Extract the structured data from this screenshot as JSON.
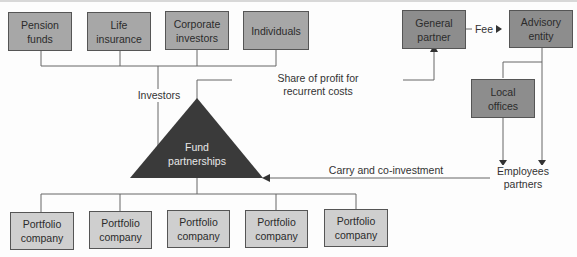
{
  "investors": [
    {
      "label": "Pension\nfunds"
    },
    {
      "label": "Life\ninsurance"
    },
    {
      "label": "Corporate\ninvestors"
    },
    {
      "label": "Individuals"
    }
  ],
  "general_partner": {
    "label": "General\npartner"
  },
  "advisory_entity": {
    "label": "Advisory\nentity"
  },
  "local_offices": {
    "label": "Local\noffices"
  },
  "fund": {
    "label": "Fund\npartnerships"
  },
  "employees": {
    "label": "Employees\npartners"
  },
  "portfolio": [
    {
      "label": "Portfolio\ncompany"
    },
    {
      "label": "Portfolio\ncompany"
    },
    {
      "label": "Portfolio\ncompany"
    },
    {
      "label": "Portfolio\ncompany"
    },
    {
      "label": "Portfolio\ncompany"
    }
  ],
  "edges": {
    "investors_label": "Investors",
    "fee_label": "Fee",
    "profit_label": "Share of profit for\nrecurrent costs",
    "carry_label": "Carry and co-investment"
  },
  "colors": {
    "investor_box": "#a7a7a7",
    "dark_box": "#8d8d8d",
    "portfolio_box": "#cfcfcf",
    "triangle": "#3a3a3a",
    "line": "#555555"
  }
}
